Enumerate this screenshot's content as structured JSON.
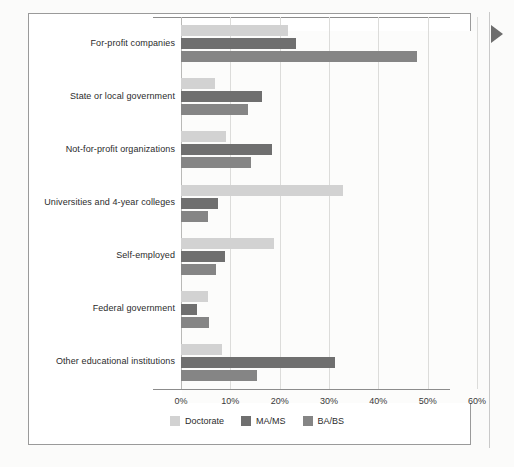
{
  "chart_data": {
    "type": "bar",
    "orientation": "horizontal",
    "title": "",
    "subtitle": "",
    "xlabel": "",
    "ylabel": "",
    "xlim": [
      0,
      60
    ],
    "xtick_labels": [
      "0%",
      "10%",
      "20%",
      "30%",
      "40%",
      "50%",
      "60%"
    ],
    "xticks": [
      0,
      10,
      20,
      30,
      40,
      50,
      60
    ],
    "grid": true,
    "legend_position": "bottom-center",
    "categories": [
      "For-profit companies",
      "State or local government",
      "Not-for-profit organizations",
      "Universities and 4-year colleges",
      "Self-employed",
      "Federal government",
      "Other educational institutions"
    ],
    "series": [
      {
        "name": "Doctorate",
        "color": "#d2d2d2",
        "values": [
          21.7,
          6.9,
          9.1,
          32.9,
          18.9,
          5.5,
          8.3
        ]
      },
      {
        "name": "MA/MS",
        "color": "#6f6f6f",
        "values": [
          23.3,
          16.4,
          18.5,
          7.5,
          8.9,
          3.2,
          31.2
        ]
      },
      {
        "name": "BA/BS",
        "color": "#858585",
        "values": [
          47.9,
          13.6,
          14.2,
          5.5,
          7.0,
          5.6,
          15.4
        ]
      }
    ]
  },
  "legend": {
    "items": [
      {
        "label": "Doctorate",
        "color": "#d2d2d2"
      },
      {
        "label": "MA/MS",
        "color": "#6f6f6f"
      },
      {
        "label": "BA/BS",
        "color": "#858585"
      }
    ]
  },
  "decorations": {
    "side_arrow": "play-arrow-right-icon"
  }
}
